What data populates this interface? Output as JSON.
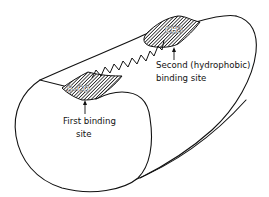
{
  "figure": {
    "line_color": "#111111",
    "background": "#ffffff"
  },
  "first_site": {
    "group_label": "S–CO",
    "label_line1": "First binding",
    "label_line2": "site"
  },
  "second_site": {
    "group_label": "CH3",
    "label_line1": "Second (hydrophobic)",
    "label_line2": "binding site"
  },
  "chain": {
    "icon": "zigzag-alkyl-chain"
  }
}
